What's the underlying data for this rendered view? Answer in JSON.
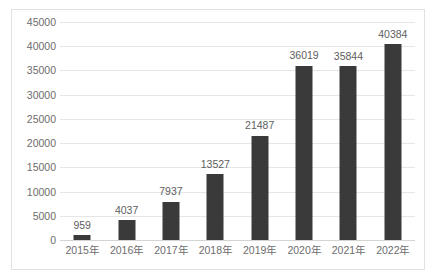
{
  "chart_data": {
    "type": "bar",
    "title": "",
    "subtitle": "",
    "xlabel": "",
    "ylabel": "",
    "categories": [
      "2015年",
      "2016年",
      "2017年",
      "2018年",
      "2019年",
      "2020年",
      "2021年",
      "2022年"
    ],
    "values": [
      959,
      4037,
      7937,
      13527,
      21487,
      36019,
      35844,
      40384
    ],
    "data_labels": [
      "959",
      "4037",
      "7937",
      "13527",
      "21487",
      "36019",
      "35844",
      "40384"
    ],
    "ylim": [
      0,
      45000
    ],
    "ytick_step": 5000,
    "ytick_labels": [
      "0",
      "5000",
      "10000",
      "15000",
      "20000",
      "25000",
      "30000",
      "35000",
      "40000",
      "45000"
    ],
    "grid": "horizontal",
    "legend": "none",
    "series": [
      {
        "name": "",
        "color": "#3a3a3a",
        "values": [
          959,
          4037,
          7937,
          13527,
          21487,
          36019,
          35844,
          40384
        ]
      }
    ]
  },
  "style": {
    "bar_color": "#3a3a3a",
    "grid_color": "#e6e6e6",
    "axis_text_color": "#6d6d6d",
    "label_text_color": "#5e5e5e",
    "frame_color": "#e2e2e2",
    "background": "#ffffff"
  }
}
